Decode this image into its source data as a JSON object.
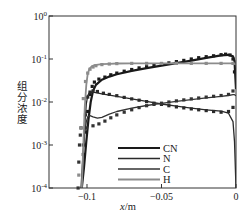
{
  "chart_data": {
    "type": "line",
    "title": "",
    "xlabel": "x/m",
    "ylabel": "组分浓度",
    "xlim": [
      -0.1255,
      0
    ],
    "ylim": [
      0.0001,
      1
    ],
    "yscale": "log",
    "grid": false,
    "legend_position": "lower right (inside)",
    "x_ticks": [
      {
        "value": -0.1,
        "label": "−0.1"
      },
      {
        "value": -0.05,
        "label": "−0.05"
      },
      {
        "value": 0,
        "label": "0"
      }
    ],
    "y_ticks": [
      {
        "value": 1,
        "label": "10",
        "exp": "0"
      },
      {
        "value": 0.1,
        "label": "10",
        "exp": "-1"
      },
      {
        "value": 0.01,
        "label": "10",
        "exp": "-2"
      },
      {
        "value": 0.001,
        "label": "10",
        "exp": "-3"
      },
      {
        "value": 0.0001,
        "label": "10",
        "exp": "-4"
      }
    ],
    "series": [
      {
        "name": "CN",
        "color": "#1a1a1a",
        "width": 2.2,
        "line": {
          "x": [
            -0.1035,
            -0.102,
            -0.1005,
            -0.099,
            -0.0975,
            -0.096,
            -0.094,
            -0.09,
            -0.085,
            -0.08,
            -0.07,
            -0.06,
            -0.05,
            -0.04,
            -0.03,
            -0.02,
            -0.01,
            -0.005,
            -0.002,
            -0.001,
            0
          ],
          "y": [
            0.0001,
            0.0003,
            0.0012,
            0.004,
            0.01,
            0.018,
            0.025,
            0.033,
            0.039,
            0.044,
            0.053,
            0.061,
            0.07,
            0.08,
            0.092,
            0.106,
            0.122,
            0.125,
            0.115,
            0.09,
            0.02
          ]
        },
        "markers": {
          "x": [
            -0.1025,
            -0.101,
            -0.0995,
            -0.098,
            -0.0965,
            -0.095,
            -0.092,
            -0.088,
            -0.084,
            -0.08,
            -0.075,
            -0.07,
            -0.065,
            -0.06,
            -0.055,
            -0.05,
            -0.045,
            -0.04,
            -0.035,
            -0.03,
            -0.025,
            -0.02,
            -0.015,
            -0.01,
            -0.007,
            -0.004,
            -0.002,
            -0.001
          ],
          "y": [
            0.0006,
            0.002,
            0.006,
            0.015,
            0.023,
            0.029,
            0.034,
            0.038,
            0.043,
            0.047,
            0.052,
            0.057,
            0.062,
            0.066,
            0.071,
            0.076,
            0.081,
            0.087,
            0.093,
            0.1,
            0.107,
            0.113,
            0.119,
            0.126,
            0.129,
            0.124,
            0.1,
            0.05
          ]
        }
      },
      {
        "name": "N",
        "color": "#2a2a2a",
        "width": 1.3,
        "line": {
          "x": [
            -0.1035,
            -0.1025,
            -0.1015,
            -0.1005,
            -0.0995,
            -0.0985,
            -0.097,
            -0.095,
            -0.09,
            -0.085,
            -0.08,
            -0.07,
            -0.06,
            -0.05,
            -0.04,
            -0.03,
            -0.02,
            -0.01,
            -0.005,
            -0.002,
            -0.001,
            0
          ],
          "y": [
            0.0001,
            0.0006,
            0.003,
            0.009,
            0.014,
            0.016,
            0.017,
            0.0168,
            0.0155,
            0.0145,
            0.0135,
            0.0118,
            0.0103,
            0.009,
            0.008,
            0.0072,
            0.0066,
            0.0061,
            0.0055,
            0.0035,
            0.0012,
            0.0001
          ]
        },
        "markers": {
          "x": [
            -0.1025,
            -0.101,
            -0.0995,
            -0.098,
            -0.096,
            -0.093,
            -0.089,
            -0.085,
            -0.08,
            -0.075,
            -0.07,
            -0.065,
            -0.06,
            -0.055,
            -0.05,
            -0.045,
            -0.04,
            -0.035,
            -0.03,
            -0.025,
            -0.02,
            -0.015,
            -0.01,
            -0.005,
            -0.002
          ],
          "y": [
            0.001,
            0.005,
            0.013,
            0.017,
            0.018,
            0.0175,
            0.016,
            0.015,
            0.014,
            0.0128,
            0.0118,
            0.011,
            0.0102,
            0.0094,
            0.0088,
            0.0082,
            0.0077,
            0.0073,
            0.0069,
            0.0066,
            0.0063,
            0.006,
            0.0058,
            0.006,
            0.0075
          ]
        }
      },
      {
        "name": "C",
        "color": "#333333",
        "width": 1.3,
        "line": {
          "x": [
            -0.104,
            -0.1025,
            -0.1015,
            -0.1005,
            -0.0995,
            -0.098,
            -0.096,
            -0.093,
            -0.09,
            -0.085,
            -0.08,
            -0.07,
            -0.06,
            -0.05,
            -0.04,
            -0.03,
            -0.02,
            -0.01,
            -0.005,
            -0.002,
            -0.001,
            0
          ],
          "y": [
            0.0001,
            0.0008,
            0.002,
            0.0035,
            0.0045,
            0.0048,
            0.0045,
            0.0042,
            0.0044,
            0.0052,
            0.006,
            0.0072,
            0.0083,
            0.0093,
            0.0103,
            0.0114,
            0.0125,
            0.0135,
            0.0142,
            0.0148,
            0.0148,
            0.014
          ]
        },
        "markers": {
          "x": [
            -0.106,
            -0.1055,
            -0.105,
            -0.1045,
            -0.104,
            -0.1005,
            -0.096,
            -0.092,
            -0.088,
            -0.084,
            -0.08,
            -0.075,
            -0.07,
            -0.065,
            -0.06,
            -0.055,
            -0.05,
            -0.045,
            -0.04,
            -0.035,
            -0.03,
            -0.025,
            -0.02,
            -0.015,
            -0.01,
            -0.005,
            -0.002
          ],
          "y": [
            0.0001,
            0.0004,
            0.001,
            0.0017,
            0.0025,
            0.0025,
            0.0028,
            0.0031,
            0.0036,
            0.0043,
            0.005,
            0.0058,
            0.0066,
            0.0074,
            0.0082,
            0.0088,
            0.0094,
            0.01,
            0.0106,
            0.0112,
            0.0118,
            0.0124,
            0.013,
            0.0136,
            0.0142,
            0.015,
            0.018
          ]
        }
      },
      {
        "name": "H",
        "color": "#8c8c8c",
        "width": 1.8,
        "line": {
          "x": [
            -0.1035,
            -0.1025,
            -0.1015,
            -0.1005,
            -0.0995,
            -0.0985,
            -0.097,
            -0.095,
            -0.09,
            -0.085,
            -0.08,
            -0.07,
            -0.06,
            -0.05,
            -0.04,
            -0.03,
            -0.02,
            -0.01,
            -0.005,
            -0.003,
            -0.001,
            0
          ],
          "y": [
            0.0001,
            0.001,
            0.008,
            0.025,
            0.045,
            0.058,
            0.067,
            0.072,
            0.076,
            0.0775,
            0.0785,
            0.079,
            0.0792,
            0.0793,
            0.0794,
            0.0794,
            0.0794,
            0.0794,
            0.0794,
            0.079,
            0.077,
            0.075
          ]
        },
        "markers": {
          "x": [
            -0.1055,
            -0.104,
            -0.1025,
            -0.101,
            -0.0995,
            -0.098,
            -0.096,
            -0.094,
            -0.09,
            -0.085,
            -0.08,
            -0.07,
            -0.06,
            -0.05,
            -0.04,
            -0.03,
            -0.02,
            -0.01,
            -0.002
          ],
          "y": [
            0.0002,
            0.0025,
            0.012,
            0.03,
            0.047,
            0.058,
            0.065,
            0.07,
            0.074,
            0.0765,
            0.078,
            0.079,
            0.079,
            0.079,
            0.079,
            0.079,
            0.079,
            0.079,
            0.079
          ]
        }
      }
    ],
    "legend": [
      {
        "name": "CN",
        "color": "#1a1a1a",
        "width": 2.2
      },
      {
        "name": "N",
        "color": "#2a2a2a",
        "width": 1.3
      },
      {
        "name": "C",
        "color": "#333333",
        "width": 1.3
      },
      {
        "name": "H",
        "color": "#8c8c8c",
        "width": 1.8
      }
    ]
  },
  "axes": {
    "xlabel_italic": "x",
    "xlabel_unit": "/m",
    "ylabel": "组分浓度"
  }
}
